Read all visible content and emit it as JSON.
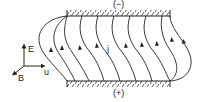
{
  "diagram": {
    "top_plate_label": "(−)",
    "bottom_plate_label": "(+)",
    "current_label": "j",
    "axes": {
      "e_label": "E",
      "b_label": "B",
      "u_label": "u"
    }
  }
}
